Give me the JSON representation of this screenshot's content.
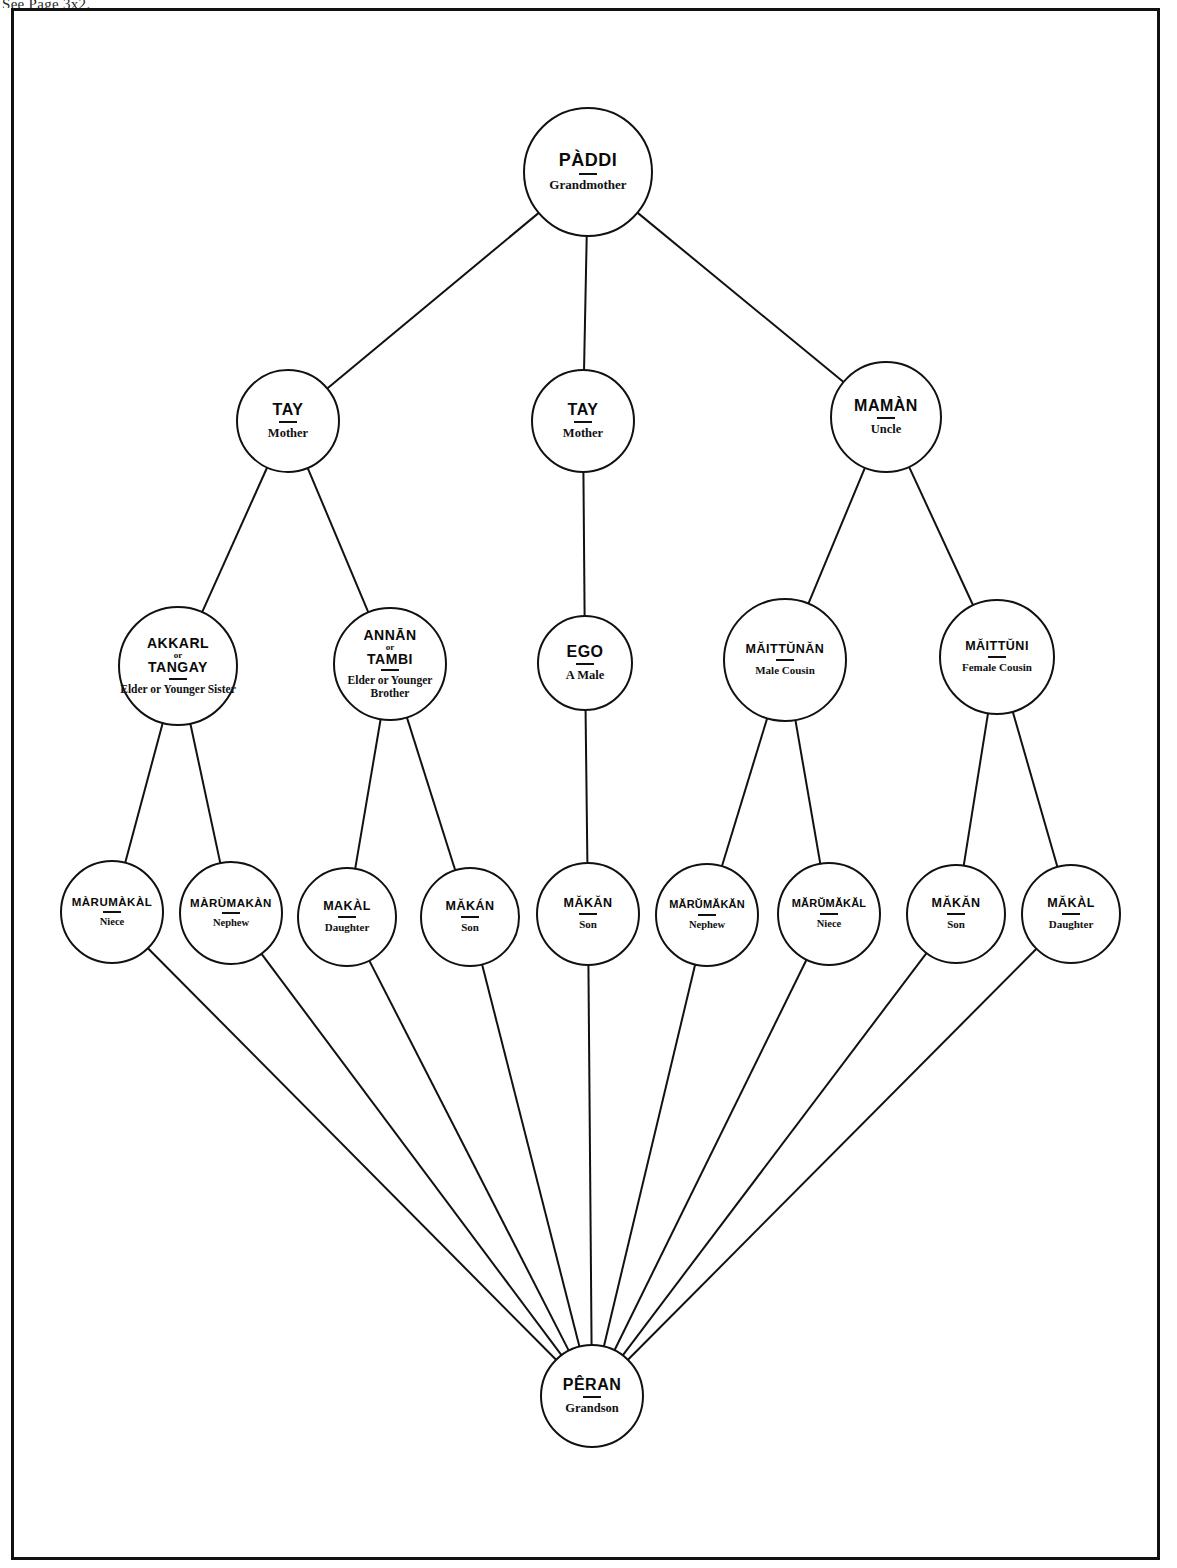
{
  "page": {
    "header_note": "See Page 3x2.",
    "frame": {
      "x": 11,
      "y": 8,
      "width": 1149,
      "height": 1552
    }
  },
  "diagram": {
    "line_color": "#111111",
    "node_fill": "#ffffff",
    "nodes": [
      {
        "id": "paddi",
        "term": "PÀDDI",
        "gloss": "Grandmother",
        "cx": 588,
        "cy": 172,
        "r": 65,
        "size": "sz-lg",
        "row": 0
      },
      {
        "id": "tay-left",
        "term": "TAY",
        "gloss": "Mother",
        "cx": 288,
        "cy": 421,
        "r": 52,
        "size": "sz-md",
        "row": 1
      },
      {
        "id": "tay-center",
        "term": "TAY",
        "gloss": "Mother",
        "cx": 583,
        "cy": 421,
        "r": 52,
        "size": "sz-md",
        "row": 1
      },
      {
        "id": "maman",
        "term": "MAMÀN",
        "gloss": "Uncle",
        "cx": 886,
        "cy": 417,
        "r": 56,
        "size": "sz-md",
        "row": 1
      },
      {
        "id": "akkarl-tangay",
        "term": "AKKARL",
        "orword": "or",
        "term2": "TANGAY",
        "gloss": "Elder or Younger Sister",
        "cx": 178,
        "cy": 666,
        "r": 60,
        "size": "sz-sm",
        "row": 2
      },
      {
        "id": "annan-tambi",
        "term": "ANNĀN",
        "orword": "or",
        "term2": "TAMBI",
        "gloss": "Elder or Younger Brother",
        "cx": 390,
        "cy": 664,
        "r": 57,
        "size": "sz-sm",
        "row": 2
      },
      {
        "id": "ego",
        "term": "EGO",
        "gloss": "A Male",
        "cx": 585,
        "cy": 663,
        "r": 48,
        "size": "sz-md",
        "row": 2
      },
      {
        "id": "maittunan",
        "term": "MĂITTŬNĂN",
        "gloss": "Male Cousin",
        "cx": 785,
        "cy": 660,
        "r": 62,
        "size": "sz-xs",
        "row": 2
      },
      {
        "id": "maittuni",
        "term": "MĂITTŬNI",
        "gloss": "Female Cousin",
        "cx": 997,
        "cy": 657,
        "r": 58,
        "size": "sz-xs",
        "row": 2
      },
      {
        "id": "marumakal-1",
        "term": "MÀRUMÀKÀL",
        "gloss": "Niece",
        "cx": 112,
        "cy": 912,
        "r": 52,
        "size": "sz-xxs",
        "row": 3
      },
      {
        "id": "marumakan-1",
        "term": "MÀRÙMAKÀN",
        "gloss": "Nephew",
        "cx": 231,
        "cy": 913,
        "r": 52,
        "size": "sz-xxs",
        "row": 3
      },
      {
        "id": "makal-1",
        "term": "MAKÀL",
        "gloss": "Daughter",
        "cx": 347,
        "cy": 917,
        "r": 50,
        "size": "sz-xs",
        "row": 3
      },
      {
        "id": "makan-1",
        "term": "MĂKÁN",
        "gloss": "Son",
        "cx": 470,
        "cy": 917,
        "r": 50,
        "size": "sz-xs",
        "row": 3
      },
      {
        "id": "makan-2",
        "term": "MĂKĂN",
        "gloss": "Son",
        "cx": 588,
        "cy": 914,
        "r": 52,
        "size": "sz-xs",
        "row": 3
      },
      {
        "id": "marumakan-2",
        "term": "MĂRŬMĂKĂN",
        "gloss": "Nephew",
        "cx": 707,
        "cy": 915,
        "r": 52,
        "size": "sz-tiny",
        "row": 3
      },
      {
        "id": "marumakal-2",
        "term": "MĂRŬMĂKĂL",
        "gloss": "Niece",
        "cx": 829,
        "cy": 914,
        "r": 52,
        "size": "sz-tiny",
        "row": 3
      },
      {
        "id": "makan-3",
        "term": "MĂKĂN",
        "gloss": "Son",
        "cx": 956,
        "cy": 914,
        "r": 50,
        "size": "sz-xs",
        "row": 3
      },
      {
        "id": "makal-2",
        "term": "MĂKÀL",
        "gloss": "Daughter",
        "cx": 1071,
        "cy": 914,
        "r": 50,
        "size": "sz-xs",
        "row": 3
      },
      {
        "id": "peran",
        "term": "PÊRAN",
        "gloss": "Grandson",
        "cx": 592,
        "cy": 1396,
        "r": 52,
        "size": "sz-md",
        "row": 4
      }
    ],
    "edges": [
      {
        "from": "paddi",
        "to": "tay-left"
      },
      {
        "from": "paddi",
        "to": "tay-center"
      },
      {
        "from": "paddi",
        "to": "maman"
      },
      {
        "from": "tay-left",
        "to": "akkarl-tangay"
      },
      {
        "from": "tay-left",
        "to": "annan-tambi"
      },
      {
        "from": "tay-center",
        "to": "ego"
      },
      {
        "from": "maman",
        "to": "maittunan"
      },
      {
        "from": "maman",
        "to": "maittuni"
      },
      {
        "from": "akkarl-tangay",
        "to": "marumakal-1"
      },
      {
        "from": "akkarl-tangay",
        "to": "marumakan-1"
      },
      {
        "from": "annan-tambi",
        "to": "makal-1"
      },
      {
        "from": "annan-tambi",
        "to": "makan-1"
      },
      {
        "from": "ego",
        "to": "makan-2"
      },
      {
        "from": "maittunan",
        "to": "marumakan-2"
      },
      {
        "from": "maittunan",
        "to": "marumakal-2"
      },
      {
        "from": "maittuni",
        "to": "makan-3"
      },
      {
        "from": "maittuni",
        "to": "makal-2"
      },
      {
        "from": "marumakal-1",
        "to": "peran"
      },
      {
        "from": "marumakan-1",
        "to": "peran"
      },
      {
        "from": "makal-1",
        "to": "peran"
      },
      {
        "from": "makan-1",
        "to": "peran"
      },
      {
        "from": "makan-2",
        "to": "peran"
      },
      {
        "from": "marumakan-2",
        "to": "peran"
      },
      {
        "from": "marumakal-2",
        "to": "peran"
      },
      {
        "from": "makan-3",
        "to": "peran"
      },
      {
        "from": "makal-2",
        "to": "peran"
      }
    ]
  }
}
